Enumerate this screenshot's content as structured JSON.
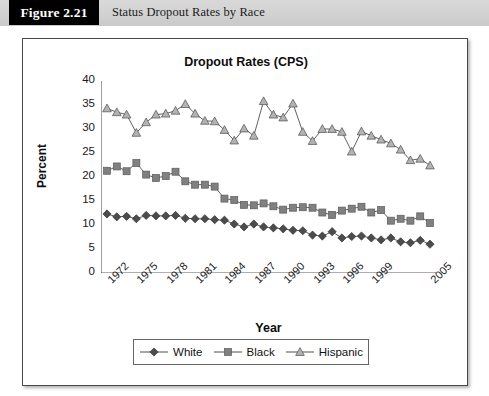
{
  "figure": {
    "number": "Figure 2.21",
    "caption": "Status Dropout Rates by Race"
  },
  "colors": {
    "white_series": "#4c4c4c",
    "black_series": "#808080",
    "hispanic_series": "#b3b3b3",
    "line": "#4f4f4f",
    "axis": "#5f5f5f",
    "header_band": "#d2d2d2",
    "figure_box": "#000000"
  },
  "chart_data": {
    "type": "line",
    "title": "Dropout Rates (CPS)",
    "xlabel": "Year",
    "ylabel": "Percent",
    "ylim": [
      0,
      40
    ],
    "ytick_labels": [
      "0",
      "5",
      "10",
      "15",
      "20",
      "25",
      "30",
      "35",
      "40"
    ],
    "yticks": [
      0,
      5,
      10,
      15,
      20,
      25,
      30,
      35,
      40
    ],
    "grid": false,
    "legend_position": "bottom",
    "x": [
      1972,
      1973,
      1974,
      1975,
      1976,
      1977,
      1978,
      1979,
      1980,
      1981,
      1982,
      1983,
      1984,
      1985,
      1986,
      1987,
      1988,
      1989,
      1990,
      1991,
      1992,
      1993,
      1994,
      1995,
      1996,
      1997,
      1998,
      1999,
      2000,
      2001,
      2002,
      2003,
      2004,
      2005
    ],
    "xtick_labels": [
      "1972",
      "1975",
      "1978",
      "1981",
      "1984",
      "1987",
      "1990",
      "1993",
      "1996",
      "1999",
      "2005"
    ],
    "xtick_label_years": [
      1972,
      1975,
      1978,
      1981,
      1984,
      1987,
      1990,
      1993,
      1996,
      1999,
      2005
    ],
    "series": [
      {
        "name": "White",
        "marker": "diamond",
        "color": "#4c4c4c",
        "values": [
          12.3,
          11.7,
          11.8,
          11.3,
          12.0,
          11.9,
          11.9,
          12.0,
          11.4,
          11.3,
          11.3,
          11.1,
          11.0,
          10.2,
          9.6,
          10.2,
          9.6,
          9.4,
          9.2,
          8.9,
          8.8,
          7.9,
          7.7,
          8.6,
          7.3,
          7.6,
          7.7,
          7.3,
          6.9,
          7.3,
          6.5,
          6.3,
          6.8,
          6.0
        ]
      },
      {
        "name": "Black",
        "marker": "square",
        "color": "#808080",
        "values": [
          21.3,
          22.2,
          21.2,
          22.9,
          20.5,
          19.8,
          20.2,
          21.1,
          19.1,
          18.4,
          18.4,
          18.0,
          15.5,
          15.2,
          14.2,
          14.1,
          14.5,
          13.9,
          13.2,
          13.6,
          13.7,
          13.6,
          12.6,
          12.1,
          13.0,
          13.4,
          13.8,
          12.6,
          13.1,
          10.9,
          11.3,
          10.9,
          11.8,
          10.4
        ]
      },
      {
        "name": "Hispanic",
        "marker": "triangle",
        "color": "#b3b3b3",
        "values": [
          34.3,
          33.5,
          33.0,
          29.2,
          31.4,
          33.0,
          33.2,
          33.8,
          35.2,
          33.2,
          31.7,
          31.6,
          29.8,
          27.6,
          30.1,
          28.6,
          35.8,
          33.0,
          32.4,
          35.3,
          29.4,
          27.5,
          30.0,
          30.0,
          29.4,
          25.3,
          29.5,
          28.6,
          27.8,
          27.0,
          25.7,
          23.5,
          23.8,
          22.4
        ]
      }
    ]
  },
  "legend": {
    "items": [
      {
        "label": "White",
        "marker": "diamond",
        "color": "#4c4c4c"
      },
      {
        "label": "Black",
        "marker": "square",
        "color": "#808080"
      },
      {
        "label": "Hispanic",
        "marker": "triangle",
        "color": "#b3b3b3"
      }
    ]
  }
}
